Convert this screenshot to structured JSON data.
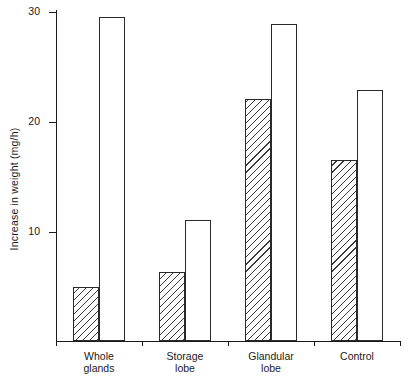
{
  "chart_data": {
    "type": "bar",
    "title": "",
    "subtitle": "",
    "xlabel": "",
    "ylabel": "Increase in weight (mg/h)",
    "categories": [
      "Whole glands",
      "Storage lobe",
      "Glandular lobe",
      "Control"
    ],
    "category_lines": [
      [
        "Whole",
        "glands"
      ],
      [
        "Storage",
        "lobe"
      ],
      [
        "Glandular",
        "lobe"
      ],
      [
        "Control"
      ]
    ],
    "series": [
      {
        "name": "hatched",
        "style": "diagonal-hatch",
        "values": [
          4.9,
          6.3,
          22.0,
          16.5
        ]
      },
      {
        "name": "open",
        "style": "open-white",
        "values": [
          29.5,
          11.0,
          28.8,
          22.8
        ]
      }
    ],
    "ylim": [
      0,
      30
    ],
    "yticks": [
      10,
      20,
      30
    ],
    "ytick_labels": [
      "10",
      "20",
      "30"
    ],
    "grid": false,
    "legend": "none",
    "axis_color": "#1a1a1a",
    "bar_edge_color": "#2a2a2a",
    "bar_fill_open": "#ffffff",
    "bar_hatch_color": "#3a3a3a",
    "background": "#ffffff"
  },
  "layout": {
    "y_axis_x": 56,
    "baseline_y": 342,
    "pixels_per_unit": 11,
    "plot_top_y": 10,
    "bar_width": 26,
    "group_starts": [
      62,
      190,
      318,
      446
    ],
    "units_label": "mg/h"
  }
}
